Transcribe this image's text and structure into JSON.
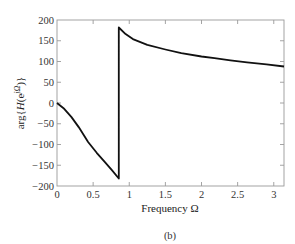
{
  "chart_data": {
    "type": "line",
    "title": "",
    "xlabel": "Frequency Ω",
    "ylabel": "arg{H(e^{jΩ})}",
    "ylabel_parts": {
      "pre": "arg{",
      "H": "H",
      "paren_open": "(e",
      "sup": "jΩ",
      "post": ")}"
    },
    "caption": "(b)",
    "xlim": [
      0,
      3.1416
    ],
    "ylim": [
      -200,
      200
    ],
    "xticks": [
      0,
      0.5,
      1,
      1.5,
      2,
      2.5,
      3
    ],
    "xtick_labels": [
      "0",
      "0.5",
      "1",
      "1.5",
      "2",
      "2.5",
      "3"
    ],
    "yticks": [
      200,
      150,
      100,
      50,
      0,
      -50,
      -100,
      -150,
      -200
    ],
    "ytick_labels": [
      "200",
      "150",
      "100",
      "50",
      "0",
      "−50",
      "−100",
      "−150",
      "−200"
    ],
    "grid": false,
    "legend": null,
    "series": [
      {
        "name": "phase",
        "color": "#111111",
        "x": [
          0,
          0.1,
          0.2,
          0.3,
          0.43,
          0.55,
          0.66,
          0.76,
          0.855,
          0.855,
          0.95,
          1.05,
          1.25,
          1.5,
          1.72,
          2.0,
          2.18,
          2.4,
          2.63,
          2.9,
          3.1416
        ],
        "y": [
          0,
          -14,
          -34,
          -58,
          -94,
          -120,
          -142,
          -162,
          -182,
          182,
          166,
          154,
          140,
          129,
          120,
          112,
          108,
          103,
          98,
          93,
          88
        ]
      }
    ]
  }
}
